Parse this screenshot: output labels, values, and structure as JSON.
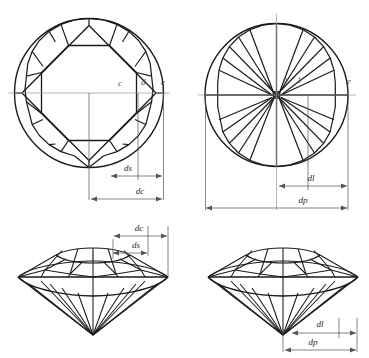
{
  "figure": {
    "background_color": "#ffffff",
    "outline_color": "#1a1a1a",
    "dimension_color": "#555555",
    "label_color": "#4a4a4a"
  },
  "panels": [
    {
      "id": "crown-view",
      "name": "Top-left crown (table-up) view",
      "point_labels": [
        {
          "text": "c",
          "x": 118,
          "y": 86
        },
        {
          "text": "d",
          "x": 141,
          "y": 85
        },
        {
          "text": "e",
          "x": 161,
          "y": 85
        }
      ],
      "dimensions": [
        {
          "text": "ds",
          "x": 128,
          "y": 171
        },
        {
          "text": "dc",
          "x": 140,
          "y": 194
        }
      ]
    },
    {
      "id": "pavilion-view",
      "name": "Top-right pavilion (table-down) view",
      "point_labels": [
        {
          "text": "g",
          "x": 283,
          "y": 82
        },
        {
          "text": "l",
          "x": 298,
          "y": 83
        },
        {
          "text": "e",
          "x": 347,
          "y": 84
        }
      ],
      "dimensions": [
        {
          "text": "dl",
          "x": 311,
          "y": 181
        },
        {
          "text": "dp",
          "x": 303,
          "y": 203
        }
      ]
    },
    {
      "id": "profile-crown-view",
      "name": "Bottom-left perspective view with crown dimensions",
      "point_labels": [],
      "dimensions": [
        {
          "text": "dc",
          "x": 139,
          "y": 231
        },
        {
          "text": "ds",
          "x": 136,
          "y": 248
        }
      ]
    },
    {
      "id": "profile-pavilion-view",
      "name": "Bottom-right perspective view with pavilion dimensions",
      "point_labels": [],
      "dimensions": [
        {
          "text": "dl",
          "x": 320,
          "y": 327
        },
        {
          "text": "dp",
          "x": 313,
          "y": 345
        }
      ]
    }
  ],
  "legend": {
    "symbols": [
      {
        "symbol": "ds",
        "meaning": "star facet dimension"
      },
      {
        "symbol": "dc",
        "meaning": "crown / table dimension"
      },
      {
        "symbol": "dl",
        "meaning": "lower girdle facet dimension"
      },
      {
        "symbol": "dp",
        "meaning": "pavilion diameter dimension"
      },
      {
        "symbol": "c",
        "meaning": "table corner point"
      },
      {
        "symbol": "d",
        "meaning": "bezel girdle point"
      },
      {
        "symbol": "e",
        "meaning": "girdle outer edge point"
      },
      {
        "symbol": "g",
        "meaning": "culet point"
      },
      {
        "symbol": "l",
        "meaning": "lower girdle junction point"
      }
    ]
  }
}
